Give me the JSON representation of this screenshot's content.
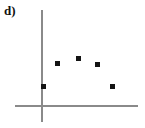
{
  "figure": {
    "panel_label": "d)",
    "background_color": "#ffffff",
    "axis_color": "#8a8a8a",
    "point_color": "#141414"
  },
  "chart_data": {
    "type": "scatter",
    "title": "d)",
    "xlabel": "",
    "ylabel": "",
    "grid": false,
    "legend": null,
    "axis_ticks": {
      "x": [],
      "y": []
    },
    "xlim": [
      0,
      5
    ],
    "ylim": [
      0,
      5
    ],
    "x": [
      0.1,
      0.8,
      1.9,
      2.9,
      3.7
    ],
    "y": [
      1.1,
      2.3,
      2.6,
      2.2,
      1.1
    ],
    "points": [
      {
        "x": 0.1,
        "y": 1.1,
        "px": 43,
        "py": 86
      },
      {
        "x": 0.8,
        "y": 2.3,
        "px": 57,
        "py": 63
      },
      {
        "x": 1.9,
        "y": 2.6,
        "px": 78,
        "py": 58
      },
      {
        "x": 2.9,
        "y": 2.2,
        "px": 97,
        "py": 64
      },
      {
        "x": 3.7,
        "y": 1.1,
        "px": 112,
        "py": 86
      }
    ],
    "description": "Scatter plot of five points forming an inverted U (concave down) pattern, rising from lower left to a peak near the centre then falling to the lower right.",
    "axes": {
      "y_axis": {
        "x": 41,
        "y_top": 10,
        "y_bottom": 122
      },
      "x_axis": {
        "y": 106,
        "x_left": 15,
        "x_right": 138
      }
    }
  }
}
